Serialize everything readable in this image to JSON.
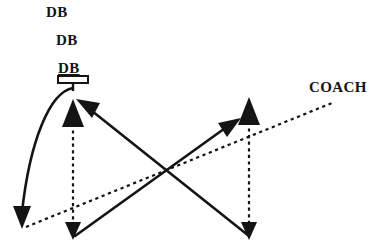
{
  "diagram": {
    "background_color": "#ffffff",
    "ink_color": "#141414",
    "width": 392,
    "height": 252,
    "labels": [
      {
        "id": "db1",
        "text": "DB",
        "x": 46,
        "y": 4,
        "underlined": false
      },
      {
        "id": "db2",
        "text": "DB",
        "x": 56,
        "y": 32,
        "underlined": false
      },
      {
        "id": "db3",
        "text": "DB",
        "x": 58,
        "y": 60,
        "underlined": true
      },
      {
        "id": "coach",
        "text": "COACH",
        "x": 309,
        "y": 79,
        "underlined": false
      }
    ],
    "player_box": {
      "name": "db-player-box",
      "x": 58,
      "y": 76,
      "width": 30,
      "height": 7,
      "stem_height": 8
    },
    "paths": [
      {
        "id": "curved-drop-path",
        "style": "solid",
        "arrow_end": "down",
        "description": "curved solid path from DB box arcing left and down to bottom-left",
        "from": [
          73,
          86
        ],
        "to": [
          22,
          228
        ]
      },
      {
        "id": "left-vertical-dashed",
        "style": "dashed",
        "arrow_start": "up",
        "arrow_end": "down",
        "description": "vertical dashed line with arrowheads both ends on left",
        "from": [
          73,
          100
        ],
        "to": [
          73,
          238
        ]
      },
      {
        "id": "right-vertical-dashed",
        "style": "dashed",
        "arrow_start": "up",
        "arrow_end": "down",
        "description": "vertical dashed line with arrowheads both ends on right",
        "from": [
          249,
          98
        ],
        "to": [
          249,
          238
        ]
      },
      {
        "id": "coach-dashed-line",
        "style": "dashed",
        "arrow_end": "none",
        "description": "dashed line from bottom-left up to COACH label",
        "from": [
          24,
          227
        ],
        "to": [
          332,
          103
        ]
      },
      {
        "id": "diagonal-to-upper-left",
        "style": "solid",
        "arrow_end": "up-left",
        "description": "solid diagonal arrow from lower-right to upper-left target",
        "from": [
          249,
          238
        ],
        "to": [
          78,
          101
        ]
      },
      {
        "id": "diagonal-to-upper-right",
        "style": "solid",
        "arrow_end": "up-right",
        "description": "solid diagonal arrow from lower-left to upper-right target",
        "from": [
          75,
          238
        ],
        "to": [
          240,
          119
        ]
      }
    ]
  }
}
